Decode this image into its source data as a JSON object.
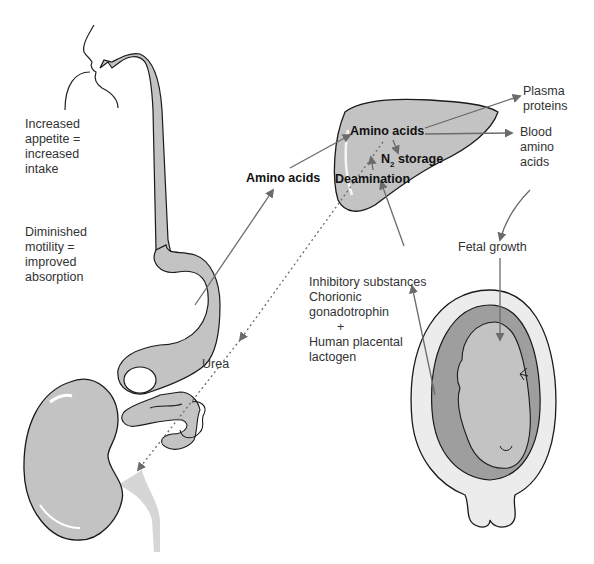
{
  "colors": {
    "organ_fill": "#c3c3c3",
    "organ_dark": "#9e9e9e",
    "outline": "#1a1a1a",
    "arrow": "#6b6b6b",
    "text": "#333333"
  },
  "labels": {
    "appetite": [
      "Increased",
      "appetite =",
      "increased",
      "intake"
    ],
    "motility": [
      "Diminished",
      "motility =",
      "improved",
      "absorption"
    ],
    "amino_acids_left": "Amino acids",
    "liver_amino_acids": "Amino acids",
    "n2_storage_prefix": "N",
    "n2_storage_sub": "2",
    "n2_storage_suffix": " storage",
    "deamination": "Deamination",
    "plasma_proteins": [
      "Plasma",
      "proteins"
    ],
    "blood_amino_acids": [
      "Blood",
      "amino",
      "acids"
    ],
    "fetal_growth": "Fetal growth",
    "hormones": [
      "Inhibitory substances",
      "Chorionic",
      "gonadotrophin",
      "+",
      "Human placental",
      "lactogen"
    ],
    "urea": "Urea"
  },
  "figure": {
    "organs": [
      "mouth-esophagus",
      "stomach",
      "small-intestine",
      "liver",
      "kidney",
      "uterus-with-fetus"
    ],
    "flows": [
      {
        "from": "intestine",
        "to": "liver",
        "label": "Amino acids",
        "style": "solid"
      },
      {
        "from": "liver",
        "to": "plasma proteins",
        "style": "solid"
      },
      {
        "from": "liver",
        "to": "blood amino acids",
        "style": "solid"
      },
      {
        "from": "blood amino acids",
        "to": "fetal growth",
        "style": "solid"
      },
      {
        "from": "uterus",
        "to": "deamination",
        "label": "Inhibitory substances",
        "style": "solid"
      },
      {
        "from": "liver",
        "to": "kidney",
        "label": "Urea",
        "style": "dotted"
      }
    ]
  }
}
